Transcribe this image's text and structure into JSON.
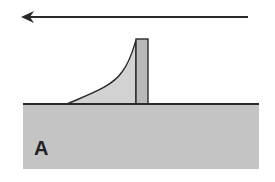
{
  "diagram": {
    "label": "A",
    "elements": {
      "wind_arrow": {
        "direction": "left",
        "meaning": "wind-direction"
      },
      "fence": {
        "description": "vertical barrier"
      },
      "drift": {
        "description": "deposit accumulated on upwind side of barrier"
      },
      "ground": {
        "description": "ground surface block"
      }
    },
    "colors": {
      "ground_fill": "#c4c4c4",
      "drift_fill": "#d0d0d0",
      "fence_fill": "#b8b8b8",
      "stroke": "#2a2a2a",
      "label": "#222222"
    }
  }
}
